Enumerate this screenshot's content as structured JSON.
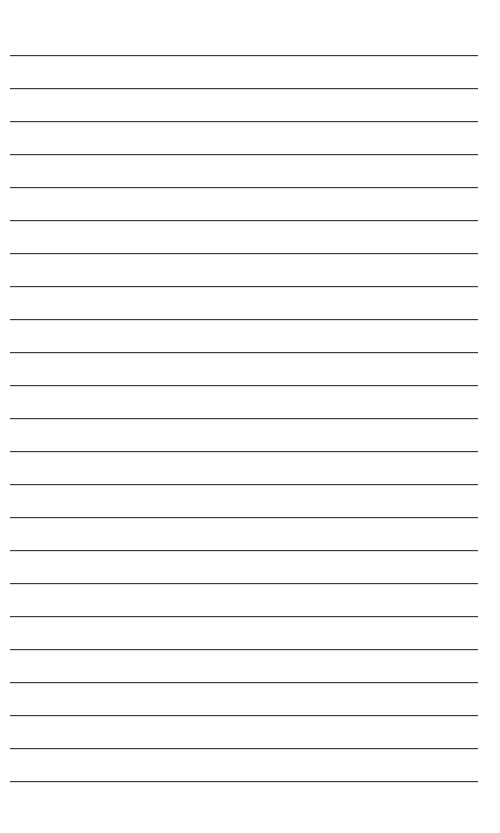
{
  "page": {
    "type": "lined-paper",
    "background_color": "#ffffff",
    "line_color": "#3c3c3c",
    "line_count": 23,
    "first_line_y": 55,
    "line_spacing": 33,
    "line_left": 10,
    "line_width": 468
  }
}
